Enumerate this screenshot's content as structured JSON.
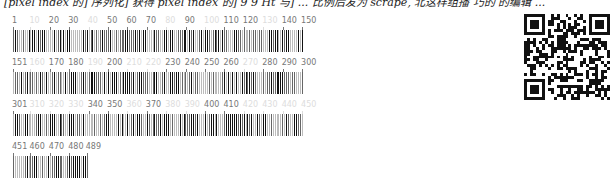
{
  "header": {
    "clipped_text": "[pixel index 的] 序列化] 获得 pixel index 的] 9 9 Ht 与] ... 比例后发为 scrape, 北这样组播 巧的 的编辑 ..."
  },
  "chart_data": {
    "type": "table",
    "title": "",
    "total_positions": 489,
    "positions_per_row": 150,
    "rows": [
      {
        "start": 1,
        "end": 150,
        "labels": [
          "1",
          "10",
          "20",
          "30",
          "40",
          "50",
          "60",
          "70",
          "80",
          "90",
          "100",
          "110",
          "120",
          "130",
          "140",
          "150"
        ],
        "faint_labels": [
          "10",
          "40",
          "80",
          "100",
          "130"
        ]
      },
      {
        "start": 151,
        "end": 300,
        "labels": [
          "151",
          "160",
          "170",
          "180",
          "190",
          "200",
          "210",
          "220",
          "230",
          "240",
          "250",
          "260",
          "270",
          "280",
          "290",
          "300"
        ],
        "faint_labels": [
          "160",
          "190",
          "210",
          "220",
          "270"
        ]
      },
      {
        "start": 301,
        "end": 450,
        "labels": [
          "301",
          "310",
          "320",
          "330",
          "340",
          "350",
          "360",
          "370",
          "380",
          "390",
          "400",
          "410",
          "420",
          "430",
          "440",
          "450"
        ],
        "faint_labels": [
          "310",
          "320",
          "330",
          "360",
          "380",
          "390",
          "420",
          "430",
          "440",
          "450"
        ]
      },
      {
        "start": 451,
        "end": 489,
        "labels": [
          "451",
          "460",
          "470",
          "480",
          "489"
        ],
        "faint_labels": []
      }
    ]
  },
  "qr_code": {
    "present": true,
    "modules": 29
  },
  "colors": {
    "bar_dark": "#111111",
    "bar_mid": "#666666",
    "bar_light": "#bbbbbb",
    "label": "#777777",
    "label_faint": "#dddddd"
  }
}
